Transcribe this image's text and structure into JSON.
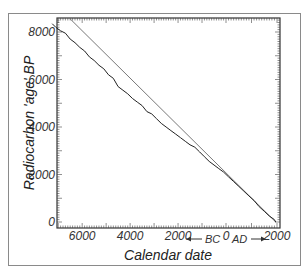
{
  "chart_data": {
    "type": "line",
    "title": "",
    "xlabel": "Calendar date",
    "ylabel": "Radiocarbon 'age' BP",
    "x_ticks": [
      "6000",
      "4000",
      "2000",
      "0",
      "2000"
    ],
    "x_tick_values": [
      -6000,
      -4000,
      -2000,
      0,
      2000
    ],
    "y_ticks": [
      "0",
      "2000",
      "4000",
      "6000",
      "8000"
    ],
    "y_tick_values": [
      0,
      2000,
      4000,
      6000,
      8000
    ],
    "xlim": [
      -7300,
      2100
    ],
    "ylim": [
      0,
      8550
    ],
    "era_labels": {
      "bc": "BC",
      "ad": "AD"
    },
    "grid": false,
    "legend": "none",
    "series": [
      {
        "name": "calibration curve",
        "style": "jagged",
        "x": [
          -7250,
          -7100,
          -6900,
          -6700,
          -6500,
          -6300,
          -6100,
          -5900,
          -5700,
          -5500,
          -5300,
          -5100,
          -4900,
          -4700,
          -4500,
          -4300,
          -4100,
          -3900,
          -3700,
          -3500,
          -3300,
          -3100,
          -2900,
          -2700,
          -2500,
          -2300,
          -2100,
          -1900,
          -1700,
          -1500,
          -1300,
          -1100,
          -900,
          -700,
          -500,
          -300,
          -100,
          100,
          300,
          500,
          700,
          900,
          1100,
          1300,
          1500,
          1700,
          1900,
          1950
        ],
        "values": [
          8350,
          8200,
          8050,
          7950,
          7700,
          7550,
          7350,
          7200,
          6950,
          6800,
          6600,
          6450,
          6200,
          6050,
          5700,
          5550,
          5400,
          5200,
          5050,
          4900,
          4650,
          4550,
          4350,
          4150,
          4000,
          3850,
          3700,
          3550,
          3400,
          3250,
          3150,
          2950,
          2750,
          2550,
          2400,
          2250,
          2100,
          1900,
          1700,
          1500,
          1300,
          1100,
          900,
          650,
          450,
          250,
          100,
          0
        ]
      },
      {
        "name": "1:1 reference line",
        "style": "straight",
        "x": [
          -6500,
          1950
        ],
        "values": [
          8550,
          0
        ]
      }
    ]
  }
}
